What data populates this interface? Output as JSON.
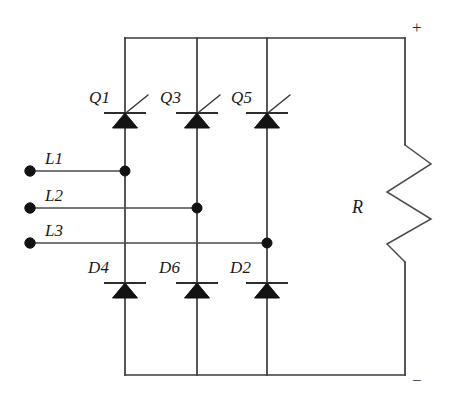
{
  "diagram": {
    "type": "circuit-schematic",
    "colors": {
      "wire": "#3a3a3a",
      "device": "#131313",
      "background": "#ffffff"
    }
  },
  "inputs": {
    "phases": [
      {
        "id": "L1",
        "label": "L1",
        "terminal_x": 30,
        "terminal_y": 171,
        "connects_leg": 1
      },
      {
        "id": "L2",
        "label": "L2",
        "terminal_x": 30,
        "terminal_y": 208,
        "connects_leg": 2
      },
      {
        "id": "L3",
        "label": "L3",
        "terminal_x": 30,
        "terminal_y": 243,
        "connects_leg": 3
      }
    ]
  },
  "upper_devices": {
    "kind": "thyristor",
    "items": [
      {
        "label": "Q1",
        "leg": 1,
        "x": 125,
        "y": 113
      },
      {
        "label": "Q3",
        "leg": 2,
        "x": 197,
        "y": 113
      },
      {
        "label": "Q5",
        "leg": 3,
        "x": 267,
        "y": 113
      }
    ]
  },
  "lower_devices": {
    "kind": "diode",
    "items": [
      {
        "label": "D4",
        "leg": 1,
        "x": 125,
        "y": 283
      },
      {
        "label": "D6",
        "leg": 2,
        "x": 197,
        "y": 283
      },
      {
        "label": "D2",
        "leg": 3,
        "x": 267,
        "y": 283
      }
    ]
  },
  "load": {
    "label": "R",
    "kind": "resistor",
    "x": 405,
    "top_y": 145,
    "bottom_y": 262
  },
  "rails": {
    "positive": {
      "label": "+",
      "y": 38
    },
    "negative": {
      "label": "−",
      "y": 375
    }
  },
  "legs": {
    "x_positions": [
      125,
      197,
      267
    ]
  }
}
